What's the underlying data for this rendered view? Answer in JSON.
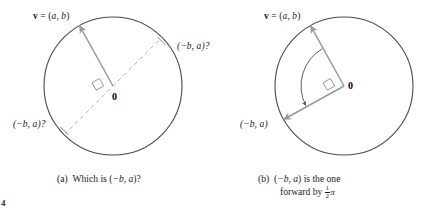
{
  "figure": {
    "background_color": "#ffffff",
    "circle_stroke": "#4a4a4a",
    "vector_color": "#9a9a9a",
    "dashed_color": "#b3b3b3",
    "arc_color": "#555555",
    "text_color": "#1a1a1a",
    "page_mark": "4"
  },
  "panel_a": {
    "id": "panel-a",
    "circle": {
      "cx": 113,
      "cy": 86,
      "r": 69
    },
    "vector_label": {
      "bold_v": "v",
      "equals": " = (",
      "a": "a",
      "comma": ", ",
      "b": "b",
      "close": ")"
    },
    "label_upper_right": "(−b, a)?",
    "label_lower_left": "(−b, a)?",
    "origin": "0",
    "caption": {
      "tag": "(a)",
      "text_plain": "Which is (−b, a)?",
      "words": "Which is (",
      "neg_b": "−b",
      "sep": ", ",
      "a": "a",
      "tail": ")?"
    }
  },
  "panel_b": {
    "id": "panel-b",
    "circle": {
      "cx": 344,
      "cy": 86,
      "r": 69
    },
    "vector_label": {
      "bold_v": "v",
      "equals": " = (",
      "a": "a",
      "comma": ", ",
      "b": "b",
      "close": ")"
    },
    "label_lower_left": "(−b, a)",
    "origin": "0",
    "caption": {
      "tag": "(b)",
      "line1_open": "(",
      "line1_neg_b": "−b",
      "line1_sep": ", ",
      "line1_a": "a",
      "line1_tail": ") is the one",
      "line2_words": "forward by ",
      "frac_num": "1",
      "frac_den": "2",
      "pi": "π"
    }
  }
}
